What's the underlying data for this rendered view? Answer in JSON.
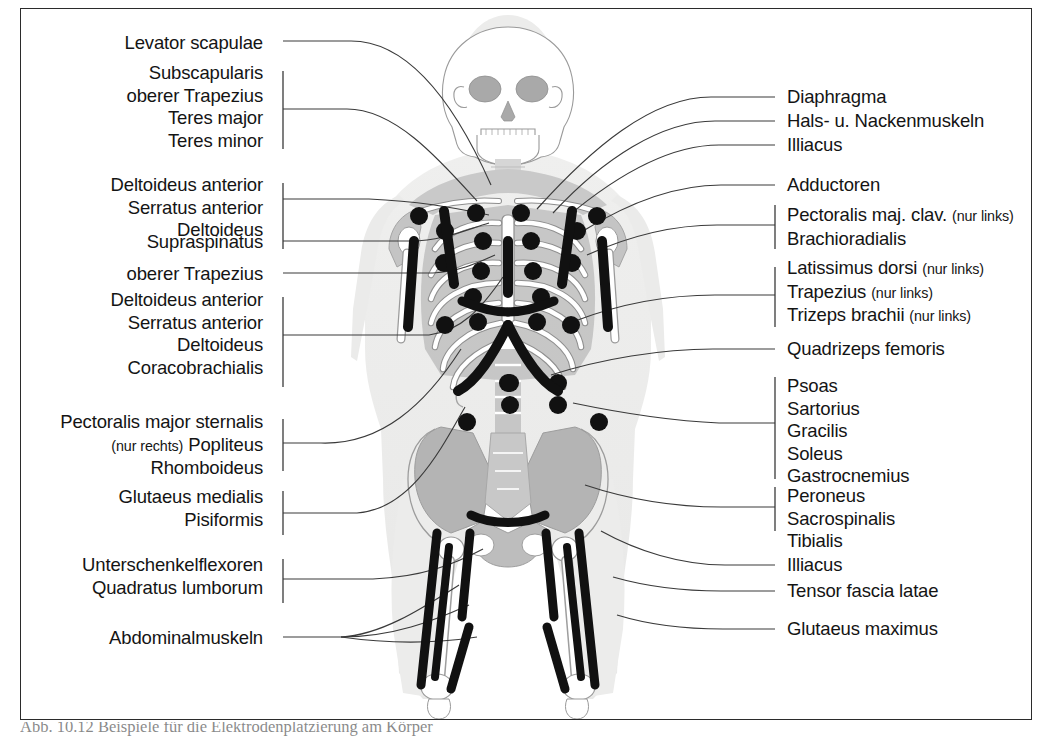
{
  "figure": {
    "type": "anatomical-electrode-placement-diagram",
    "body_view": "anterior full-body skeleton with muscle shading",
    "colors": {
      "frame_border": "#2b2b2b",
      "background": "#ffffff",
      "body_silhouette": "#ececeb",
      "bone_fill": "#ffffff",
      "bone_outline": "#8d8d8d",
      "muscle_shading": "#b8b8b8",
      "soft_tissue_shading": "#d2d2d2",
      "electrode_black": "#111111",
      "leader_line": "#3a3a3a"
    }
  },
  "left_labels": [
    {
      "id": "levator-scapulae",
      "lines": [
        {
          "text": "Levator scapulae"
        }
      ]
    },
    {
      "id": "subscapularis-group",
      "lines": [
        {
          "text": "Subscapularis"
        },
        {
          "text": "oberer Trapezius"
        },
        {
          "text": "Teres major"
        },
        {
          "text": "Teres minor"
        }
      ]
    },
    {
      "id": "deltoideus-serratus-group",
      "lines": [
        {
          "text": "Deltoideus anterior"
        },
        {
          "text": "Serratus anterior"
        },
        {
          "text": "Deltoideus"
        }
      ]
    },
    {
      "id": "supraspinatus",
      "lines": [
        {
          "text": "Supraspinatus"
        }
      ]
    },
    {
      "id": "oberer-trapezius",
      "lines": [
        {
          "text": "oberer Trapezius"
        }
      ]
    },
    {
      "id": "deltoideus-coracobrachialis-group",
      "lines": [
        {
          "text": "Deltoideus anterior"
        },
        {
          "text": "Serratus anterior"
        },
        {
          "text": "Deltoideus"
        },
        {
          "text": "Coracobrachialis"
        }
      ]
    },
    {
      "id": "pectoralis-popliteus-group",
      "lines": [
        {
          "text": "Pectoralis major sternalis"
        },
        {
          "text": "Popliteus",
          "qualifier": "(nur rechts)",
          "qualifier_position": "before"
        },
        {
          "text": "Rhomboideus"
        }
      ]
    },
    {
      "id": "glutaeus-pisiformis-group",
      "lines": [
        {
          "text": "Glutaeus medialis"
        },
        {
          "text": "Pisiformis"
        }
      ]
    },
    {
      "id": "unterschenkelflexoren-group",
      "lines": [
        {
          "text": "Unterschenkelflexoren"
        },
        {
          "text": "Quadratus lumborum"
        }
      ]
    },
    {
      "id": "abdominalmuskeln",
      "lines": [
        {
          "text": "Abdominalmuskeln"
        }
      ]
    }
  ],
  "right_labels": [
    {
      "id": "diaphragma",
      "lines": [
        {
          "text": "Diaphragma"
        }
      ]
    },
    {
      "id": "hals-nackenmuskeln",
      "lines": [
        {
          "text": "Hals- u. Nackenmuskeln"
        }
      ]
    },
    {
      "id": "illiacus-upper",
      "lines": [
        {
          "text": "Illiacus"
        }
      ]
    },
    {
      "id": "adductoren",
      "lines": [
        {
          "text": "Adductoren"
        }
      ]
    },
    {
      "id": "pectoralis-brachioradialis-group",
      "lines": [
        {
          "text": "Pectoralis maj. clav.",
          "qualifier": "(nur links)",
          "qualifier_position": "after"
        },
        {
          "text": "Brachioradialis"
        }
      ]
    },
    {
      "id": "latissimus-trizeps-group",
      "lines": [
        {
          "text": " Latissimus dorsi",
          "qualifier": "(nur links)",
          "qualifier_position": "after"
        },
        {
          "text": "Trapezius",
          "qualifier": "(nur links)",
          "qualifier_position": "after"
        },
        {
          "text": "Trizeps brachii",
          "qualifier": "(nur links)",
          "qualifier_position": "after"
        }
      ]
    },
    {
      "id": "quadrizeps-femoris",
      "lines": [
        {
          "text": "Quadrizeps femoris"
        }
      ]
    },
    {
      "id": "psoas-gastrocnemius-group",
      "lines": [
        {
          "text": "Psoas"
        },
        {
          "text": "Sartorius"
        },
        {
          "text": "Gracilis"
        },
        {
          "text": "Soleus"
        },
        {
          "text": "Gastrocnemius"
        }
      ]
    },
    {
      "id": "peroneus-tibialis-group",
      "lines": [
        {
          "text": "Peroneus"
        },
        {
          "text": "Sacrospinalis"
        },
        {
          "text": "Tibialis"
        }
      ]
    },
    {
      "id": "illiacus-lower",
      "lines": [
        {
          "text": "Illiacus"
        }
      ]
    },
    {
      "id": "tensor-fascia-latae",
      "lines": [
        {
          "text": "Tensor fascia latae"
        }
      ]
    },
    {
      "id": "glutaeus-maximus",
      "lines": [
        {
          "text": "Glutaeus maximus"
        }
      ]
    }
  ],
  "caption": {
    "text": "Abb. 10.12 Beispiele für die Elektrodenplatzierung am Körper"
  }
}
